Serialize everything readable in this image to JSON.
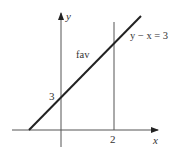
{
  "diagram": {
    "type": "region-plot",
    "axes": {
      "x_label": "x",
      "y_label": "y"
    },
    "line_label": "y − x = 3",
    "region_label": "fav",
    "y_intercept_label": "3",
    "vertical_line_label": "2",
    "colors": {
      "stroke": "#2a2a2a",
      "axis": "#555555",
      "text": "#333333"
    }
  }
}
